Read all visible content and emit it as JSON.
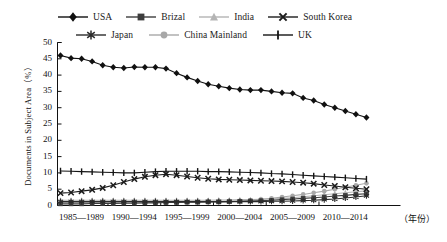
{
  "chart_data": {
    "type": "line",
    "title": "",
    "xlabel": "年份",
    "ylabel": "Documents in Subject Area（%）",
    "ylim": [
      0,
      50
    ],
    "ytick_step": 5,
    "yticks": [
      0,
      5,
      10,
      15,
      20,
      25,
      30,
      35,
      40,
      45,
      50
    ],
    "grid": false,
    "legend_position": "top",
    "x": [
      1985,
      1986,
      1987,
      1988,
      1989,
      1990,
      1991,
      1992,
      1993,
      1994,
      1995,
      1996,
      1997,
      1998,
      1999,
      2000,
      2001,
      2002,
      2003,
      2004,
      2005,
      2006,
      2007,
      2008,
      2009,
      2010,
      2011,
      2012,
      2013,
      2014
    ],
    "xtick_labels": [
      "1985—1989",
      "1990—1994",
      "1995—1999",
      "2000—2004",
      "2005—2009",
      "2010—2014"
    ],
    "xaxis_unit_label": "（年份）",
    "series": [
      {
        "name": "USA",
        "color": "#111111",
        "marker": "diamond",
        "values": [
          46.0,
          45.2,
          45.0,
          44.2,
          43.0,
          42.4,
          42.2,
          42.5,
          42.4,
          42.4,
          42.0,
          40.6,
          39.3,
          38.2,
          37.2,
          36.6,
          36.0,
          35.6,
          35.4,
          35.4,
          35.0,
          34.6,
          34.4,
          33.0,
          32.2,
          31.0,
          30.0,
          29.0,
          28.0,
          27.0
        ]
      },
      {
        "name": "Brizal",
        "color": "#3d3d3d",
        "marker": "square",
        "values": [
          0.5,
          0.5,
          0.5,
          0.6,
          0.6,
          0.6,
          0.7,
          0.7,
          0.8,
          0.8,
          0.9,
          0.9,
          1.0,
          1.0,
          1.1,
          1.1,
          1.2,
          1.3,
          1.4,
          1.5,
          1.6,
          1.8,
          2.0,
          2.2,
          2.4,
          2.6,
          2.9,
          3.1,
          3.4,
          3.6
        ]
      },
      {
        "name": "India",
        "color": "#b4b4b4",
        "marker": "triangle",
        "values": [
          1.6,
          1.6,
          1.6,
          1.6,
          1.6,
          1.6,
          1.6,
          1.6,
          1.6,
          1.6,
          1.6,
          1.6,
          1.6,
          1.6,
          1.6,
          1.7,
          1.7,
          1.8,
          1.8,
          1.9,
          2.0,
          2.2,
          2.4,
          2.7,
          3.0,
          3.3,
          3.6,
          3.9,
          4.2,
          4.5
        ]
      },
      {
        "name": "South Korea",
        "color": "#1c1c1c",
        "marker": "cross",
        "values": [
          3.8,
          4.0,
          4.4,
          4.8,
          5.4,
          6.2,
          7.2,
          8.1,
          8.8,
          9.3,
          9.6,
          9.3,
          8.9,
          8.5,
          8.2,
          8.0,
          7.9,
          7.8,
          7.7,
          7.6,
          7.5,
          7.4,
          7.2,
          7.0,
          6.7,
          6.3,
          6.0,
          5.6,
          5.3,
          5.0
        ]
      },
      {
        "name": "Japan",
        "color": "#2b2b2b",
        "marker": "asterisk",
        "values": [
          1.2,
          1.2,
          1.2,
          1.2,
          1.2,
          1.2,
          1.2,
          1.2,
          1.2,
          1.2,
          1.2,
          1.2,
          1.2,
          1.2,
          1.2,
          1.2,
          1.2,
          1.2,
          1.2,
          1.2,
          1.3,
          1.3,
          1.4,
          1.5,
          1.6,
          1.8,
          2.0,
          2.3,
          2.6,
          3.0
        ]
      },
      {
        "name": "China Mainland",
        "color": "#a8a8a8",
        "marker": "circle",
        "values": [
          0.9,
          0.9,
          0.9,
          0.9,
          0.9,
          0.9,
          1.0,
          1.0,
          1.0,
          1.0,
          1.0,
          1.0,
          1.1,
          1.1,
          1.2,
          1.2,
          1.3,
          1.4,
          1.6,
          1.9,
          2.2,
          2.6,
          3.0,
          3.4,
          3.9,
          4.4,
          5.0,
          5.6,
          6.2,
          6.8
        ]
      },
      {
        "name": "UK",
        "color": "#151515",
        "marker": "plus",
        "values": [
          10.6,
          10.5,
          10.4,
          10.3,
          10.2,
          10.1,
          10.0,
          10.0,
          10.2,
          10.4,
          10.5,
          10.5,
          10.5,
          10.5,
          10.4,
          10.4,
          10.3,
          10.2,
          10.1,
          10.0,
          9.8,
          9.7,
          9.5,
          9.3,
          9.1,
          8.9,
          8.7,
          8.5,
          8.3,
          8.1
        ]
      }
    ]
  },
  "legend": {
    "row1": [
      "USA",
      "Brizal",
      "India",
      "South Korea"
    ],
    "row2": [
      "Japan",
      "China Mainland",
      "UK"
    ]
  },
  "axes": {
    "y_title": "Documents in Subject Area（%）",
    "y_ticks": [
      "50",
      "45",
      "40",
      "35",
      "30",
      "25",
      "20",
      "15",
      "10",
      "5",
      "0"
    ],
    "x_ticks": [
      "1985—1989",
      "1990—1994",
      "1995—1999",
      "2000—2004",
      "2005—2009",
      "2010—2014"
    ],
    "x_unit": "（年份）"
  }
}
